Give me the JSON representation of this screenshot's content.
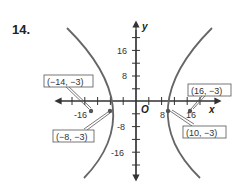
{
  "problem_number": "14.",
  "axes": {
    "x_label": "x",
    "y_label": "y",
    "origin_label": "O",
    "x_ticks": [
      "-16",
      "8",
      "16"
    ],
    "y_ticks": [
      "16",
      "8",
      "-8",
      "-16"
    ]
  },
  "points": [
    {
      "label": "(−14, −3)",
      "role": "focus"
    },
    {
      "label": "(−8, −3)",
      "role": "vertex"
    },
    {
      "label": "(16, −3)",
      "role": "focus"
    },
    {
      "label": "(10, −3)",
      "role": "vertex"
    }
  ],
  "colors": {
    "curve": "#666666",
    "axis": "#333333",
    "box_border": "#555555"
  }
}
